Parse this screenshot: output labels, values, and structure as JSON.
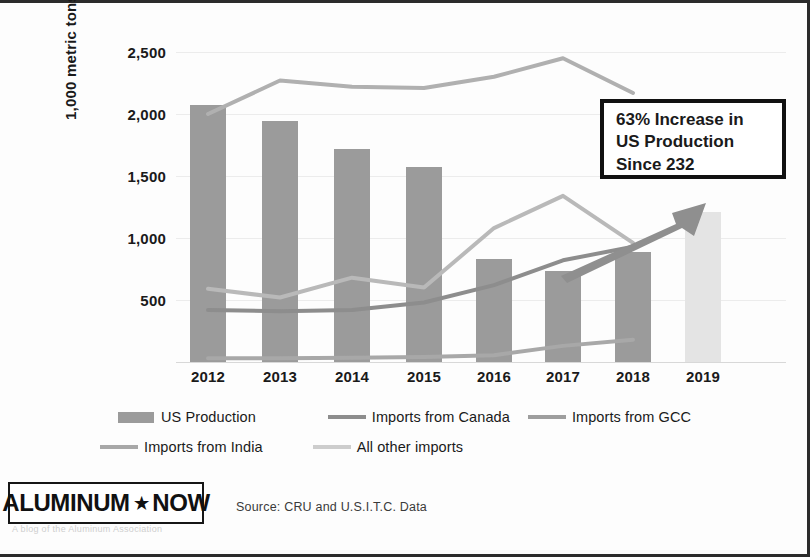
{
  "chart_data": {
    "type": "bar",
    "title": "",
    "xlabel": "",
    "ylabel": "1,000 metric tons",
    "categories": [
      "2012",
      "2013",
      "2014",
      "2015",
      "2016",
      "2017",
      "2018",
      "2019"
    ],
    "ylim": [
      0,
      2750
    ],
    "yticks": [
      500,
      1000,
      1500,
      2000,
      2500
    ],
    "ytick_labels": [
      "500",
      "1,000",
      "1,500",
      "2,000",
      "2,500"
    ],
    "grid": true,
    "legend_position": "bottom",
    "series": [
      {
        "name": "US Production",
        "type": "bar",
        "values": [
          2075,
          1940,
          1720,
          1575,
          830,
          730,
          890,
          1210
        ],
        "color": "#9b9b9b",
        "highlight_index": 7,
        "highlight_color": "#e4e4e4"
      },
      {
        "name": "Imports from Canada",
        "type": "line",
        "values": [
          420,
          410,
          420,
          480,
          620,
          820,
          930,
          null
        ],
        "color": "#8d8d8d"
      },
      {
        "name": "Imports from GCC",
        "type": "line",
        "values": [
          590,
          520,
          680,
          600,
          1080,
          1340,
          960,
          null
        ],
        "color": "#b9b9b9"
      },
      {
        "name": "Imports from India",
        "type": "line",
        "values": [
          30,
          30,
          35,
          40,
          55,
          130,
          180,
          null
        ],
        "color": "#a8a8a8"
      },
      {
        "name": "All other imports",
        "type": "line",
        "values": [
          2000,
          2270,
          2220,
          2210,
          2300,
          2450,
          2170,
          null
        ],
        "color": "#b0b0b0"
      }
    ],
    "annotations": [
      {
        "name": "callout",
        "text_lines": [
          "63% Increase in",
          "US Production",
          "Since 232"
        ],
        "arrow": "upward trend arrow from 2017 to 2019"
      }
    ]
  },
  "axis": {
    "y_title": "1,000 metric tons",
    "y_labels": [
      "2,500",
      "2,000",
      "1,500",
      "1,000",
      "500"
    ],
    "x_labels": [
      "2012",
      "2013",
      "2014",
      "2015",
      "2016",
      "2017",
      "2018",
      "2019"
    ]
  },
  "callout": {
    "line1": "63% Increase in",
    "line2": "US Production",
    "line3": "Since 232"
  },
  "legend": {
    "row1": [
      {
        "label": "US Production",
        "marker": "bar",
        "color": "#9b9b9b"
      },
      {
        "label": "Imports from Canada",
        "marker": "line",
        "color": "#8d8d8d"
      },
      {
        "label": "Imports from GCC",
        "marker": "line",
        "color": "#9e9e9e"
      }
    ],
    "row2": [
      {
        "label": "Imports from India",
        "marker": "line",
        "color": "#a8a8a8"
      },
      {
        "label": "All other imports",
        "marker": "line",
        "color": "#cdcdcd"
      }
    ]
  },
  "footer": {
    "logo_word1": "ALUMINUM",
    "logo_star": "★",
    "logo_word2": "NOW",
    "logo_subtitle": "A blog of the Aluminum Association",
    "source": "Source: CRU and U.S.I.T.C. Data"
  }
}
